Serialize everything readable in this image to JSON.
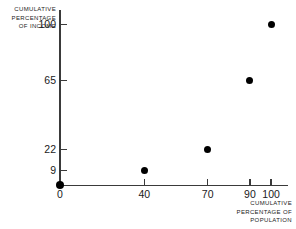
{
  "chart_data": {
    "type": "scatter",
    "title": "",
    "xlabel": "CUMULATIVE PERCENTAGE OF POPULATION",
    "ylabel": "CUMULATIVE PERCENTAGE OF INCOME",
    "xlabel_lines": [
      "CUMULATIVE",
      "PERCENTAGE OF",
      "POPULATION"
    ],
    "ylabel_lines": [
      "CUMULATIVE",
      "PERCENTAGE",
      "OF INCOME"
    ],
    "x": [
      0,
      40,
      70,
      90,
      100
    ],
    "y": [
      0,
      9,
      22,
      65,
      100
    ],
    "points": [
      {
        "x": 0,
        "y": 0
      },
      {
        "x": 40,
        "y": 9
      },
      {
        "x": 70,
        "y": 22
      },
      {
        "x": 90,
        "y": 65
      },
      {
        "x": 100,
        "y": 100
      }
    ],
    "xticks": [
      0,
      40,
      70,
      90,
      100
    ],
    "xtick_labels": [
      "0",
      "40",
      "70",
      "90",
      "100"
    ],
    "yticks": [
      9,
      22,
      65,
      100
    ],
    "ytick_labels": [
      "9",
      "22",
      "65",
      "100"
    ],
    "xlim": [
      0,
      108
    ],
    "ylim": [
      0,
      108
    ],
    "grid": false,
    "legend": false,
    "marker_color": "#000000",
    "axis_color": "#3a3a3a",
    "background_color": "#ffffff"
  }
}
